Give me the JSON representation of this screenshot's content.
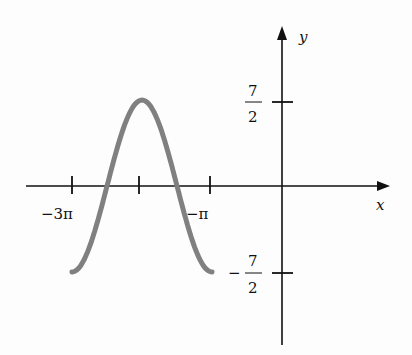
{
  "chart_data": {
    "type": "line",
    "title": "",
    "xlabel": "x",
    "ylabel": "y",
    "function": "y = (7/2) cos(x), one period",
    "x_ticks": [
      {
        "value": -9.4248,
        "label": "−3π"
      },
      {
        "value": -6.2832,
        "label": ""
      },
      {
        "value": -3.1416,
        "label": "−π"
      }
    ],
    "y_ticks": [
      {
        "value": 3.5,
        "label_num": "7",
        "label_den": "2",
        "sign": ""
      },
      {
        "value": -3.5,
        "label_num": "7",
        "label_den": "2",
        "sign": "−"
      }
    ],
    "series": [
      {
        "name": "curve",
        "x_range": [
          -9.4248,
          -3.1416
        ],
        "points": [
          {
            "x": -9.4248,
            "y": 3.5
          },
          {
            "x": -7.854,
            "y": 0
          },
          {
            "x": -6.2832,
            "y": -3.5
          },
          {
            "x": -4.7124,
            "y": 0
          },
          {
            "x": -3.1416,
            "y": 3.5
          }
        ],
        "color": "#7f7f7f"
      }
    ],
    "grid": false,
    "legend": "none"
  },
  "labels": {
    "x_axis": "x",
    "y_axis": "y",
    "tick_neg3pi": "−3π",
    "tick_negpi": "−π",
    "y_pos_num": "7",
    "y_pos_den": "2",
    "y_neg_sign": "−",
    "y_neg_num": "7",
    "y_neg_den": "2"
  }
}
